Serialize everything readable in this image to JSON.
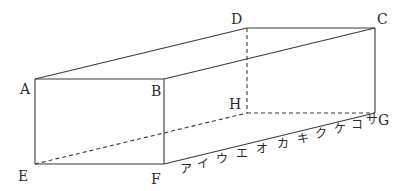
{
  "diagram": {
    "type": "rectangular-prism",
    "vertices": {
      "A": {
        "label": "A",
        "x": 35,
        "y": 79
      },
      "B": {
        "label": "B",
        "x": 164,
        "y": 79
      },
      "C": {
        "label": "C",
        "x": 375,
        "y": 28
      },
      "D": {
        "label": "D",
        "x": 247,
        "y": 28
      },
      "E": {
        "label": "E",
        "x": 35,
        "y": 164
      },
      "F": {
        "label": "F",
        "x": 164,
        "y": 164
      },
      "G": {
        "label": "G",
        "x": 375,
        "y": 113
      },
      "H": {
        "label": "H",
        "x": 247,
        "y": 113
      }
    },
    "solid_edges": [
      "AB",
      "BF",
      "FE",
      "EA",
      "AD",
      "DC",
      "BC",
      "CG",
      "FG"
    ],
    "hidden_edges": [
      "DH",
      "HG",
      "EH",
      "EG"
    ],
    "edge_FG_ticks": [
      "ア",
      "イ",
      "ウ",
      "エ",
      "オ",
      "カ",
      "キ",
      "ク",
      "ケ",
      "コ",
      "サ"
    ]
  }
}
